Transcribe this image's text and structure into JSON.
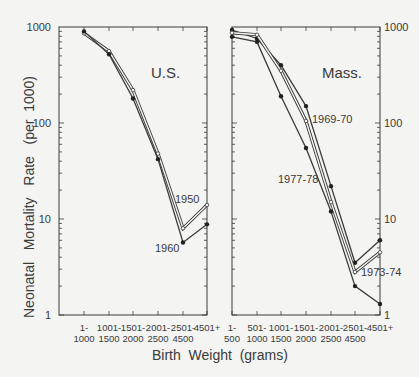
{
  "chart_data": [
    {
      "type": "line",
      "panel": "U.S.",
      "yscale": "log",
      "ylim": [
        1,
        1000
      ],
      "yticks": [
        "1000",
        "100",
        "10",
        "1"
      ],
      "categories": [
        "1-1000",
        "1001-1500",
        "1501-2000",
        "2001-2500",
        "2501-4500",
        "4501+"
      ],
      "category_lines": [
        [
          "1-",
          "1000"
        ],
        [
          "1001-",
          "1500"
        ],
        [
          "1501-",
          "2000"
        ],
        [
          "2001-",
          "2500"
        ],
        [
          "2501-",
          "4500"
        ],
        [
          "4501+",
          ""
        ]
      ],
      "series": [
        {
          "name": "1950",
          "marker": "open",
          "values": [
            860,
            560,
            220,
            48,
            8,
            14
          ]
        },
        {
          "name": "1960",
          "marker": "filled",
          "values": [
            900,
            520,
            180,
            42,
            5.7,
            8.8
          ]
        }
      ]
    },
    {
      "type": "line",
      "panel": "Mass.",
      "yscale": "log",
      "ylim": [
        1,
        1000
      ],
      "yticks": [
        "1000",
        "100",
        "10",
        "1"
      ],
      "categories": [
        "1-500",
        "501-1000",
        "1001-1500",
        "1501-2000",
        "2001-2500",
        "2501-4500",
        "4501+"
      ],
      "category_lines": [
        [
          "1-",
          "500"
        ],
        [
          "501-",
          "1000"
        ],
        [
          "1001-",
          "1500"
        ],
        [
          "1501-",
          "2000"
        ],
        [
          "2001-",
          "2500"
        ],
        [
          "2501-",
          "4500"
        ],
        [
          "4501+",
          ""
        ]
      ],
      "series": [
        {
          "name": "1969-70",
          "marker": "filled",
          "values": [
            930,
            760,
            400,
            150,
            22,
            3.5,
            6
          ]
        },
        {
          "name": "1973-74",
          "marker": "open",
          "values": [
            870,
            830,
            350,
            105,
            15,
            2.8,
            4.5
          ]
        },
        {
          "name": "1977-78",
          "marker": "filled",
          "values": [
            790,
            700,
            190,
            55,
            12,
            2,
            1.3
          ]
        }
      ]
    }
  ],
  "labels": {
    "ylabel": "Neonatal   Mortality   Rate   (per  1000)",
    "xlabel": "Birth  Weight  (grams)",
    "panel_us": "U.S.",
    "panel_mass": "Mass.",
    "series_1950": "1950",
    "series_1960": "1960",
    "series_6970": "1969-70",
    "series_7374": "1973-74",
    "series_7778": "1977-78"
  }
}
